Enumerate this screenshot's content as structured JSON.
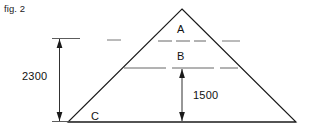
{
  "figure": {
    "caption": "fig. 2",
    "type": "technical-drawing-triangle-cross-section"
  },
  "zones": [
    {
      "id": "A",
      "label": "A"
    },
    {
      "id": "B",
      "label": "B"
    },
    {
      "id": "C",
      "label": "C"
    }
  ],
  "dimensions": [
    {
      "id": "overall-height",
      "label": "2300",
      "orientation": "vertical",
      "position": "left"
    },
    {
      "id": "lower-height",
      "label": "1500",
      "orientation": "vertical",
      "position": "center"
    }
  ],
  "colors": {
    "line": "#1a1a1a",
    "dashed_line": "#555555",
    "text": "#111111",
    "background": "#ffffff"
  },
  "geometry": {
    "apex": {
      "x": 182,
      "y": 9
    },
    "base_left": {
      "x": 68,
      "y": 122
    },
    "base_right": {
      "x": 296,
      "y": 122
    },
    "line_a_y": 41,
    "line_b_y": 68
  }
}
